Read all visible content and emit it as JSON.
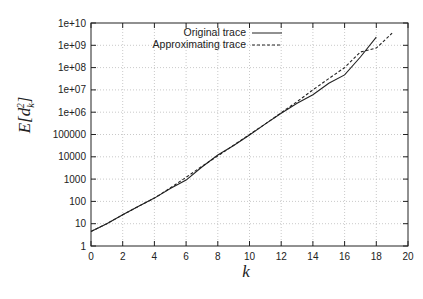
{
  "chart_data": {
    "type": "line",
    "title": "",
    "xlabel": "k",
    "ylabel": "E[d_k^2]",
    "xlim": [
      0,
      20
    ],
    "ylim": [
      1,
      10000000000.0
    ],
    "yscale": "log",
    "grid": true,
    "legend_position": "top-left",
    "x_ticks": [
      "0",
      "2",
      "4",
      "6",
      "8",
      "10",
      "12",
      "14",
      "16",
      "18",
      "20"
    ],
    "y_ticks": [
      "1",
      "10",
      "100",
      "1000",
      "10000",
      "100000",
      "1e+06",
      "1e+07",
      "1e+08",
      "1e+09",
      "1e+10"
    ],
    "series": [
      {
        "name": "Original trace",
        "style": "solid",
        "x": [
          0,
          1,
          2,
          3,
          4,
          5,
          6,
          7,
          8,
          9,
          10,
          11,
          12,
          13,
          14,
          15,
          16,
          17,
          18
        ],
        "values": [
          4.5,
          10,
          25,
          60,
          140,
          380,
          900,
          3500,
          12000,
          32000,
          95000,
          300000,
          900000,
          2500000,
          6000000,
          20000000,
          47000000,
          300000000,
          2300000000
        ]
      },
      {
        "name": "Approximating trace",
        "style": "dashed",
        "x": [
          0,
          1,
          2,
          3,
          4,
          5,
          6,
          7,
          8,
          9,
          10,
          11,
          12,
          13,
          14,
          15,
          16,
          17,
          18,
          19
        ],
        "values": [
          4.5,
          10,
          25,
          60,
          140,
          400,
          1200,
          3700,
          11000,
          33000,
          100000,
          300000,
          950000,
          3000000,
          10000000,
          32000000,
          100000000,
          500000000,
          750000000,
          3500000000
        ]
      }
    ]
  }
}
